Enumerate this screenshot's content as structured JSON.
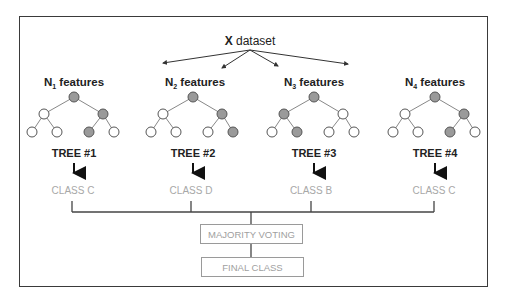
{
  "dataset": {
    "bold": "X",
    "label": "dataset"
  },
  "trees": [
    {
      "feature_n": "N",
      "feature_sub": "1",
      "feature_label": "features",
      "tree_label": "TREE #1",
      "class_label": "CLASS C",
      "cx": 74,
      "shaded": [
        0,
        2,
        5
      ]
    },
    {
      "feature_n": "N",
      "feature_sub": "2",
      "feature_label": "features",
      "tree_label": "TREE #2",
      "class_label": "CLASS D",
      "cx": 193,
      "shaded": [
        0,
        2,
        6
      ]
    },
    {
      "feature_n": "N",
      "feature_sub": "3",
      "feature_label": "features",
      "tree_label": "TREE #3",
      "class_label": "CLASS B",
      "cx": 314,
      "shaded": [
        0,
        1,
        4
      ]
    },
    {
      "feature_n": "N",
      "feature_sub": "4",
      "feature_label": "features",
      "tree_label": "TREE #4",
      "class_label": "CLASS C",
      "cx": 435,
      "shaded": [
        0,
        2,
        5
      ]
    }
  ],
  "aggregation": {
    "majority_voting": "MAJORITY VOTING",
    "final_class": "FINAL CLASS"
  },
  "colors": {
    "shaded_node": "#9a9a9a",
    "empty_node": "#ffffff",
    "node_stroke": "#555555",
    "edge": "#888888",
    "class_text": "#a8a8a8",
    "frame": "#3a3a3a"
  }
}
